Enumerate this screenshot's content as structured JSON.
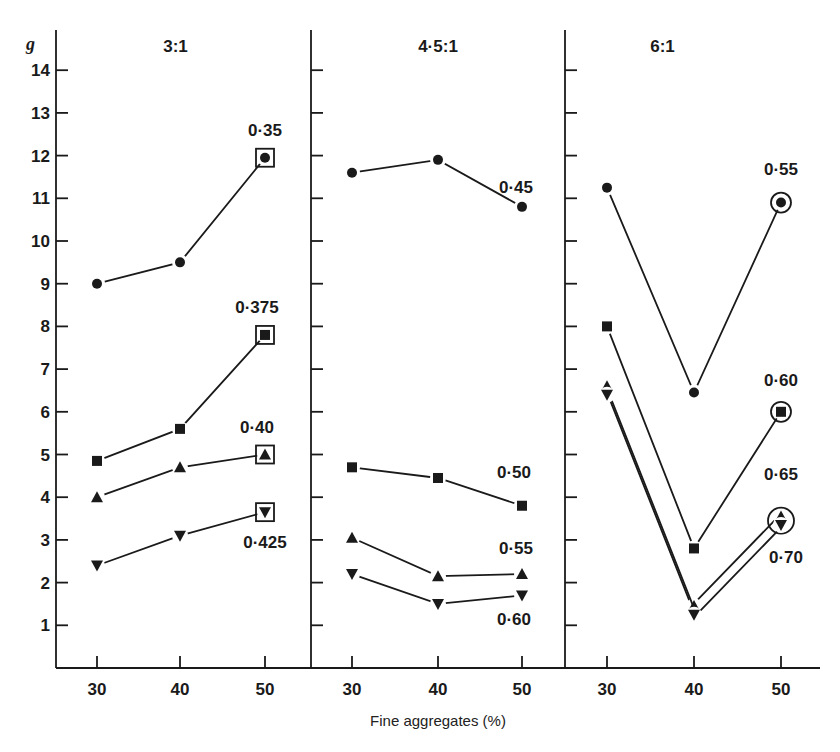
{
  "chart_data": {
    "type": "line",
    "title": "",
    "ylabel": "g",
    "xlabel": "Fine aggregates (%)",
    "ylim": [
      0,
      15
    ],
    "yticks": [
      1,
      2,
      3,
      4,
      5,
      6,
      7,
      8,
      9,
      10,
      11,
      12,
      13,
      14
    ],
    "grid": false,
    "legend": "inline labels at line ends",
    "x": [
      30,
      40,
      50
    ],
    "panels": [
      {
        "title": "3:1",
        "series": [
          {
            "name": "0·35",
            "marker": "circle",
            "values": [
              9.0,
              9.5,
              11.95
            ],
            "end_marker_boxed": "square"
          },
          {
            "name": "0·375",
            "marker": "square",
            "values": [
              4.85,
              5.6,
              7.8
            ],
            "end_marker_boxed": "square"
          },
          {
            "name": "0·40",
            "marker": "triangle-up",
            "values": [
              4.0,
              4.7,
              5.0
            ],
            "end_marker_boxed": "square"
          },
          {
            "name": "0·425",
            "marker": "triangle-down",
            "values": [
              2.4,
              3.1,
              3.65
            ],
            "end_marker_boxed": "square"
          }
        ]
      },
      {
        "title": "4·5:1",
        "series": [
          {
            "name": "0·45",
            "marker": "circle",
            "values": [
              11.6,
              11.9,
              10.8
            ]
          },
          {
            "name": "0·50",
            "marker": "square",
            "values": [
              4.7,
              4.45,
              3.8
            ]
          },
          {
            "name": "0·55",
            "marker": "triangle-up",
            "values": [
              3.05,
              2.15,
              2.2
            ]
          },
          {
            "name": "0·60",
            "marker": "triangle-down",
            "values": [
              2.2,
              1.5,
              1.7
            ]
          }
        ]
      },
      {
        "title": "6:1",
        "series": [
          {
            "name": "0·55",
            "marker": "circle",
            "values": [
              11.25,
              6.45,
              10.9
            ],
            "end_marker_boxed": "circle"
          },
          {
            "name": "0·60",
            "marker": "square",
            "values": [
              8.0,
              2.8,
              6.0
            ],
            "end_marker_boxed": "circle"
          },
          {
            "name": "0·65",
            "marker": "triangle-up",
            "values": [
              6.6,
              1.45,
              3.55
            ],
            "end_marker_boxed": "circle"
          },
          {
            "name": "0·70",
            "marker": "triangle-down",
            "values": [
              6.4,
              1.25,
              3.35
            ],
            "end_marker_boxed": "circle"
          }
        ]
      }
    ]
  },
  "labels": {
    "y_axis": "g",
    "x_axis": "Fine aggregates (%)",
    "x_ticks": [
      "30",
      "40",
      "50"
    ],
    "y_ticks": [
      "1",
      "2",
      "3",
      "4",
      "5",
      "6",
      "7",
      "8",
      "9",
      "10",
      "11",
      "12",
      "13",
      "14"
    ],
    "panel_titles": [
      "3:1",
      "4·5:1",
      "6:1"
    ]
  },
  "colors": {
    "ink": "#1a1a1a",
    "background": "#ffffff"
  }
}
